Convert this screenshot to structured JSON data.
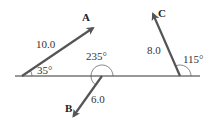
{
  "diagram": {
    "type": "vector-diagram",
    "baseline": {
      "x1": 15,
      "x2": 200,
      "y": 76,
      "color": "#333333"
    },
    "vectors": [
      {
        "name": "A",
        "magnitude_label": "10.0",
        "angle_label": "35°",
        "angle_deg": 35,
        "magnitude": 10.0,
        "origin": [
          22,
          76
        ],
        "tip": [
          95,
          27
        ],
        "color": "#555555"
      },
      {
        "name": "B",
        "magnitude_label": "6.0",
        "angle_label": "235°",
        "angle_deg": 235,
        "magnitude": 6.0,
        "origin": [
          102,
          76
        ],
        "tip": [
          72,
          118
        ],
        "color": "#555555"
      },
      {
        "name": "C",
        "magnitude_label": "8.0",
        "angle_label": "115°",
        "angle_deg": 115,
        "magnitude": 8.0,
        "origin": [
          180,
          76
        ],
        "tip": [
          152,
          12
        ],
        "color": "#555555"
      }
    ]
  }
}
